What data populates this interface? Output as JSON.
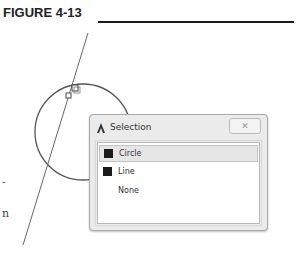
{
  "figure": {
    "title": "FIGURE 4-13"
  },
  "page_fragments": [
    {
      "text": "-",
      "x": 2,
      "y": 176
    },
    {
      "text": "n",
      "x": 2,
      "y": 207
    }
  ],
  "drawing": {
    "line": {
      "x1": 88,
      "y1": 33,
      "x2": 23,
      "y2": 245,
      "color": "#666666"
    },
    "circle": {
      "cx": 83,
      "cy": 132,
      "r": 48,
      "color": "#555555"
    },
    "grip_small": {
      "x": 66,
      "y": 93,
      "size": 5
    },
    "cursor_box": {
      "x": 72,
      "y": 85,
      "size": 6
    }
  },
  "dialog": {
    "title": "Selection",
    "icon": "autocad-a-icon",
    "close_label": "✕",
    "items": [
      {
        "label": "Circle",
        "swatch": true,
        "selected": true
      },
      {
        "label": "Line",
        "swatch": true,
        "selected": false
      },
      {
        "label": "None",
        "swatch": false,
        "selected": false
      }
    ]
  }
}
